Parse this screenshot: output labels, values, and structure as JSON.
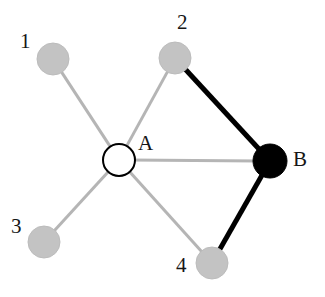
{
  "figure": {
    "background": "#ffffff",
    "width": 325,
    "height": 297
  },
  "style": {
    "gray_node_fill": "#c3c3c3",
    "gray_node_stroke": "#bcbcbc",
    "black_node_fill": "#000000",
    "white_node_fill": "#ffffff",
    "white_node_stroke": "#000000",
    "gray_edge_color": "#b5b5b5",
    "black_edge_color": "#000000",
    "gray_edge_width": 3,
    "black_edge_width": 5,
    "label_color": "#161616"
  },
  "graph": {
    "nodes": [
      {
        "id": "1",
        "label": "1",
        "cx": 53,
        "cy": 59,
        "r": 16,
        "kind": "gray",
        "label_x": 20,
        "label_y": 31
      },
      {
        "id": "2",
        "label": "2",
        "cx": 175,
        "cy": 58,
        "r": 16,
        "kind": "gray",
        "label_x": 177,
        "label_y": 12
      },
      {
        "id": "3",
        "label": "3",
        "cx": 44,
        "cy": 242,
        "r": 16,
        "kind": "gray",
        "label_x": 11,
        "label_y": 216
      },
      {
        "id": "4",
        "label": "4",
        "cx": 212,
        "cy": 263,
        "r": 16,
        "kind": "gray",
        "label_x": 176,
        "label_y": 255
      },
      {
        "id": "A",
        "label": "A",
        "cx": 119,
        "cy": 160,
        "r": 16,
        "kind": "white",
        "label_x": 138,
        "label_y": 133
      },
      {
        "id": "B",
        "label": "B",
        "cx": 270,
        "cy": 161,
        "r": 17,
        "kind": "black",
        "label_x": 293,
        "label_y": 149
      }
    ],
    "edges": [
      {
        "from": "A",
        "to": "1",
        "kind": "gray"
      },
      {
        "from": "A",
        "to": "2",
        "kind": "gray"
      },
      {
        "from": "A",
        "to": "3",
        "kind": "gray"
      },
      {
        "from": "A",
        "to": "4",
        "kind": "gray"
      },
      {
        "from": "A",
        "to": "B",
        "kind": "gray"
      },
      {
        "from": "2",
        "to": "B",
        "kind": "black"
      },
      {
        "from": "4",
        "to": "B",
        "kind": "black"
      }
    ]
  }
}
